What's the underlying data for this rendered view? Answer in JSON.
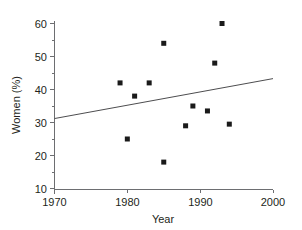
{
  "chart_data": {
    "type": "scatter",
    "title": "",
    "xlabel": "Year",
    "ylabel": "Women (%)",
    "xlim": [
      1970,
      2000
    ],
    "ylim": [
      10,
      60
    ],
    "xticks": [
      1970,
      1980,
      1990,
      2000
    ],
    "yticks": [
      10,
      20,
      30,
      40,
      50,
      60
    ],
    "xtick_labels": [
      "1970",
      "1980",
      "1990",
      "2000"
    ],
    "ytick_labels": [
      "10",
      "20",
      "30",
      "40",
      "50",
      "60"
    ],
    "grid": false,
    "legend": false,
    "minor_ticks_y": [
      15,
      25,
      35,
      45,
      55
    ],
    "points": [
      {
        "x": 1979,
        "y": 42
      },
      {
        "x": 1980,
        "y": 25
      },
      {
        "x": 1981,
        "y": 38
      },
      {
        "x": 1983,
        "y": 42
      },
      {
        "x": 1985,
        "y": 54
      },
      {
        "x": 1985,
        "y": 18
      },
      {
        "x": 1988,
        "y": 29
      },
      {
        "x": 1989,
        "y": 35
      },
      {
        "x": 1991,
        "y": 33.5
      },
      {
        "x": 1992,
        "y": 48
      },
      {
        "x": 1993,
        "y": 60
      },
      {
        "x": 1994,
        "y": 29.5
      }
    ],
    "series": [
      {
        "name": "Women (%) by year",
        "marker": "square",
        "marker_color": "#1a1a1a",
        "x": [
          1979,
          1980,
          1981,
          1983,
          1985,
          1985,
          1988,
          1989,
          1991,
          1992,
          1993,
          1994
        ],
        "values": [
          42,
          25,
          38,
          42,
          54,
          18,
          29,
          35,
          33.5,
          48,
          60,
          29.5
        ]
      }
    ],
    "trendline": {
      "type": "line",
      "x_start": 1970,
      "y_start": 31.2,
      "x_end": 2000,
      "y_end": 43.3,
      "color": "#4d4d4f"
    },
    "axis_color": "#6d6e71",
    "text_color": "#231f20"
  }
}
